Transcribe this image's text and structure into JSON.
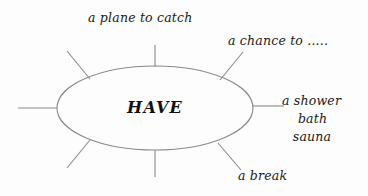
{
  "diagram": {
    "type": "word-web",
    "center_term": "HAVE",
    "background_color": "#fdfdfd",
    "line_color": "#8a8a8a",
    "text_color": "#1a1a1a",
    "ellipse": {
      "center_x": 155,
      "center_y": 108,
      "radius_x": 98,
      "radius_y": 42
    },
    "spokes": [
      {
        "name": "left",
        "x1": 18,
        "y1": 108,
        "x2": 57,
        "y2": 108
      },
      {
        "name": "upper-left",
        "x1": 67,
        "y1": 51,
        "x2": 90,
        "y2": 79
      },
      {
        "name": "top",
        "x1": 155,
        "y1": 45,
        "x2": 155,
        "y2": 67
      },
      {
        "name": "upper-right",
        "x1": 243,
        "y1": 52,
        "x2": 220,
        "y2": 80
      },
      {
        "name": "right",
        "x1": 252,
        "y1": 106,
        "x2": 284,
        "y2": 106
      },
      {
        "name": "lower-right",
        "x1": 218,
        "y1": 143,
        "x2": 241,
        "y2": 170
      },
      {
        "name": "bottom",
        "x1": 155,
        "y1": 150,
        "x2": 155,
        "y2": 177
      },
      {
        "name": "lower-left",
        "x1": 90,
        "y1": 140,
        "x2": 67,
        "y2": 168
      }
    ],
    "labels": [
      {
        "id": "plane",
        "text": "a plane to catch",
        "spoke": "top"
      },
      {
        "id": "chance",
        "text": "a chance to .....",
        "spoke": "upper-right"
      },
      {
        "id": "break",
        "text": "a break",
        "spoke": "lower-right"
      }
    ],
    "label_shower": {
      "line1": "a shower",
      "line2": "bath",
      "line3": "sauna",
      "spoke": "right"
    }
  }
}
